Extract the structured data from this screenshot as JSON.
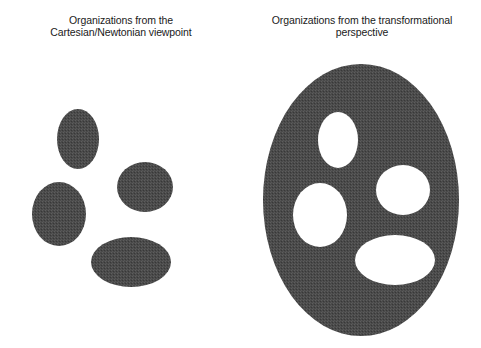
{
  "left_panel": {
    "title_line1": "Organizations from the",
    "title_line2": "Cartesian/Newtonian viewpoint",
    "shapes": [
      {
        "name": "top",
        "cx": 78,
        "cy": 139,
        "rx": 21,
        "ry": 30
      },
      {
        "name": "right",
        "cx": 145,
        "cy": 187,
        "rx": 28,
        "ry": 25
      },
      {
        "name": "left",
        "cx": 59,
        "cy": 214,
        "rx": 27,
        "ry": 32
      },
      {
        "name": "bottom",
        "cx": 131,
        "cy": 262,
        "rx": 40,
        "ry": 25
      }
    ]
  },
  "right_panel": {
    "title_line1": "Organizations from the transformational",
    "title_line2": "perspective",
    "container": {
      "cx": 361,
      "cy": 200,
      "rx": 98,
      "ry": 136
    },
    "holes": [
      {
        "name": "top",
        "cx": 338,
        "cy": 140,
        "rx": 20,
        "ry": 28
      },
      {
        "name": "right",
        "cx": 403,
        "cy": 190,
        "rx": 27,
        "ry": 25
      },
      {
        "name": "left",
        "cx": 320,
        "cy": 215,
        "rx": 27,
        "ry": 32
      },
      {
        "name": "bottom",
        "cx": 395,
        "cy": 260,
        "rx": 40,
        "ry": 25
      }
    ]
  },
  "colors": {
    "fill": "#4a4a4a",
    "background": "#ffffff",
    "text": "#1a1a1a"
  }
}
